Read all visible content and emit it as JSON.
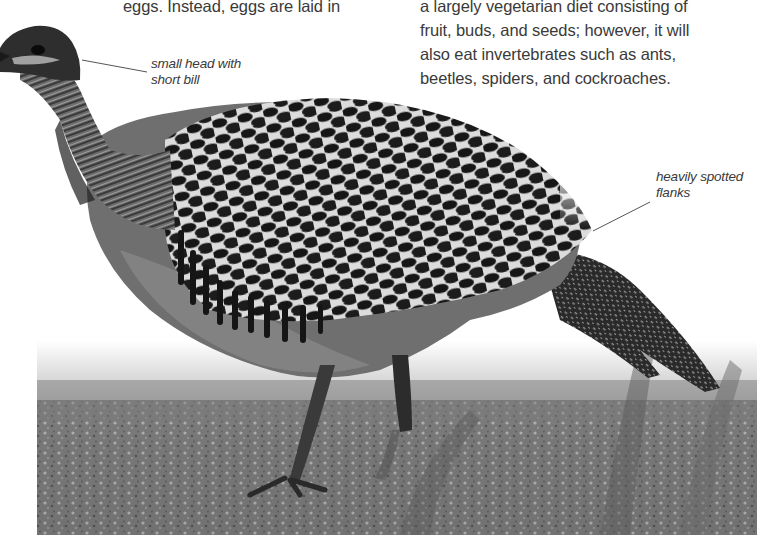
{
  "page": {
    "left_column": {
      "lines": [
        "eggs. Instead, eggs are laid in"
      ]
    },
    "right_column": {
      "lines": [
        "a largely vegetarian diet consisting of",
        "fruit, buds, and seeds; however, it will",
        "also eat invertebrates such as ants,",
        "beetles, spiders, and cockroaches."
      ]
    },
    "annotations": [
      {
        "id": "head",
        "lines": [
          "small head with",
          "short bill"
        ]
      },
      {
        "id": "flanks",
        "lines": [
          "heavily spotted",
          "flanks"
        ]
      }
    ]
  },
  "photo": {
    "subject": "ground-dwelling bird with heavily spotted wings, walking left to right-facing-left",
    "style": "grayscale photograph fading to white at top",
    "colors": {
      "text": "#3a3a3a",
      "background": "#ffffff",
      "ground": "#6e6e6e",
      "plumage_dark": "#1a1a1a",
      "plumage_light": "#d8d8d8"
    }
  }
}
